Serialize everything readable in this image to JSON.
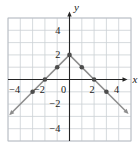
{
  "chart_data": {
    "type": "line",
    "title": "",
    "xlabel": "x",
    "ylabel": "y",
    "xlim": [
      -5,
      5
    ],
    "ylim": [
      -5,
      5
    ],
    "grid": true,
    "series": [
      {
        "name": "left-branch",
        "from": [
          0,
          2
        ],
        "to": [
          -4.7,
          -2.7
        ],
        "arrow": true
      },
      {
        "name": "right-branch",
        "from": [
          0,
          2
        ],
        "to": [
          4.6,
          -2.6
        ],
        "arrow": true
      }
    ],
    "marked_points": [
      [
        -3,
        -1
      ],
      [
        -2,
        0
      ],
      [
        -1,
        1
      ],
      [
        0,
        2
      ],
      [
        1,
        1
      ],
      [
        2,
        0
      ],
      [
        3,
        -1
      ]
    ],
    "x_tick_labels": [
      {
        "value": -4,
        "label": "−4"
      },
      {
        "value": -2,
        "label": "−2"
      },
      {
        "value": 0,
        "label": "0"
      },
      {
        "value": 2,
        "label": "2"
      },
      {
        "value": 4,
        "label": "4"
      }
    ],
    "y_tick_labels": [
      {
        "value": 4,
        "label": "4"
      },
      {
        "value": 2,
        "label": "2"
      },
      {
        "value": -2,
        "label": "−2"
      },
      {
        "value": -4,
        "label": "−4"
      }
    ],
    "colors": {
      "background": "#ffffff",
      "grid": "#cbd0d4",
      "grid_border": "#b4bac0",
      "axis": "#242424",
      "line": "#8d8d8d",
      "point": "#4c4c4c",
      "label": "#1a1a1a"
    }
  }
}
